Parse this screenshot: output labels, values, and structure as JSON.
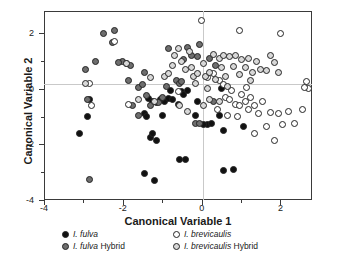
{
  "chart_data": {
    "type": "scatter",
    "title": "",
    "xlabel": "Canonical Variable 1",
    "ylabel": "Canonical Variable 2",
    "xlim": [
      -4,
      2.8
    ],
    "ylim": [
      -4,
      2.8
    ],
    "xticks": [
      -4,
      -2,
      0,
      2
    ],
    "yticks": [
      2,
      0,
      -2,
      -4
    ],
    "xtick_labels": [
      "-4",
      "-2",
      "0",
      "2"
    ],
    "ytick_labels": [
      "2",
      "0",
      "-2",
      "-4"
    ],
    "grid": "zero-lines-only",
    "legend_position": "below-axes",
    "series": [
      {
        "name": "I. fulva",
        "key": "f",
        "marker": "filled-circle",
        "color": "#111111",
        "edge_color": "#242424",
        "points": [
          [
            -1.35,
            -0.35
          ],
          [
            -1.25,
            -0.45
          ],
          [
            -1.15,
            -0.5
          ],
          [
            -1.45,
            -0.9
          ],
          [
            -1.4,
            -1.0
          ],
          [
            -1.3,
            -1.75
          ],
          [
            -1.25,
            -1.6
          ],
          [
            -1.15,
            -1.85
          ],
          [
            -1.0,
            -0.95
          ],
          [
            -0.95,
            -0.45
          ],
          [
            -0.85,
            -0.35
          ],
          [
            -0.8,
            -0.05
          ],
          [
            -0.75,
            -0.4
          ],
          [
            -0.6,
            -0.55
          ],
          [
            -0.5,
            -0.1
          ],
          [
            -0.45,
            -0.2
          ],
          [
            -0.35,
            -0.05
          ],
          [
            -0.55,
            -2.55
          ],
          [
            -0.4,
            -2.55
          ],
          [
            -1.2,
            -3.3
          ],
          [
            -1.45,
            -3.05
          ],
          [
            -2.9,
            -1.0
          ],
          [
            -3.1,
            -1.6
          ],
          [
            -2.85,
            -0.4
          ],
          [
            0.15,
            -1.3
          ],
          [
            0.25,
            -1.25
          ],
          [
            0.45,
            -0.95
          ],
          [
            0.5,
            0.0
          ],
          [
            0.55,
            -1.5
          ],
          [
            0.55,
            -2.95
          ],
          [
            0.8,
            -2.9
          ],
          [
            1.05,
            -1.35
          ],
          [
            -0.1,
            -0.45
          ],
          [
            -0.15,
            -0.95
          ],
          [
            0.05,
            -1.3
          ],
          [
            -1.05,
            -0.4
          ]
        ]
      },
      {
        "name": "I. fulva Hybrid",
        "key": "fh",
        "marker": "dark-gray-circle",
        "color": "#6e6e6e",
        "edge_color": "#242424",
        "points": [
          [
            -2.5,
            2.0
          ],
          [
            -2.2,
            2.1
          ],
          [
            -2.25,
            1.65
          ],
          [
            -2.7,
            1.0
          ],
          [
            -2.95,
            0.7
          ],
          [
            -2.9,
            -0.4
          ],
          [
            -2.85,
            -3.25
          ],
          [
            -2.0,
            1.0
          ],
          [
            -1.9,
            0.9
          ],
          [
            -1.8,
            0.85
          ],
          [
            -1.85,
            0.3
          ],
          [
            -1.75,
            -0.6
          ],
          [
            -1.6,
            0.05
          ],
          [
            -1.45,
            0.6
          ],
          [
            -1.5,
            0.15
          ],
          [
            -1.4,
            -0.25
          ],
          [
            -1.3,
            -0.6
          ],
          [
            -1.1,
            -0.5
          ],
          [
            -1.0,
            -0.3
          ],
          [
            -0.9,
            0.1
          ],
          [
            -0.65,
            0.3
          ],
          [
            -0.55,
            0.2
          ],
          [
            -0.45,
            1.05
          ],
          [
            -0.35,
            1.5
          ],
          [
            -0.25,
            1.2
          ],
          [
            -0.05,
            1.6
          ],
          [
            -0.1,
            1.15
          ],
          [
            0.2,
            1.1
          ],
          [
            0.35,
            0.85
          ],
          [
            -0.15,
            -1.25
          ],
          [
            -0.05,
            -1.25
          ],
          [
            0.3,
            -0.45
          ],
          [
            -0.5,
            0.25
          ],
          [
            -1.6,
            -0.95
          ],
          [
            -2.1,
            0.95
          ],
          [
            -0.85,
            1.45
          ]
        ]
      },
      {
        "name": "I. brevicaulis",
        "key": "b",
        "marker": "open-circle",
        "color": "#ffffff",
        "edge_color": "#242424",
        "points": [
          [
            -2.85,
            0.2
          ],
          [
            -2.8,
            -0.6
          ],
          [
            -2.2,
            1.7
          ],
          [
            -1.85,
            -0.55
          ],
          [
            -0.6,
            -0.1
          ],
          [
            0.0,
            2.45
          ],
          [
            0.95,
            2.1
          ],
          [
            2.0,
            2.0
          ],
          [
            0.45,
            0.3
          ],
          [
            0.55,
            0.15
          ],
          [
            0.6,
            -0.3
          ],
          [
            0.7,
            -0.4
          ],
          [
            0.75,
            -0.05
          ],
          [
            0.85,
            -0.55
          ],
          [
            0.95,
            -0.6
          ],
          [
            1.0,
            -0.2
          ],
          [
            1.1,
            -0.45
          ],
          [
            1.2,
            -0.75
          ],
          [
            1.25,
            -0.3
          ],
          [
            1.35,
            -0.6
          ],
          [
            1.45,
            -0.9
          ],
          [
            1.55,
            -0.45
          ],
          [
            1.65,
            -1.35
          ],
          [
            1.75,
            -0.85
          ],
          [
            1.85,
            -1.85
          ],
          [
            1.95,
            -0.9
          ],
          [
            2.05,
            -1.3
          ],
          [
            2.2,
            -0.8
          ],
          [
            2.35,
            -1.25
          ],
          [
            2.55,
            -0.75
          ],
          [
            2.65,
            0.25
          ],
          [
            2.7,
            0.0
          ],
          [
            2.6,
            0.05
          ],
          [
            1.35,
            -1.6
          ],
          [
            0.9,
            -1.0
          ],
          [
            0.65,
            -0.95
          ],
          [
            0.3,
            0.55
          ],
          [
            0.15,
            0.4
          ],
          [
            0.4,
            -0.75
          ],
          [
            1.15,
            0.05
          ]
        ]
      },
      {
        "name": "I. brevicaulis Hybrid",
        "key": "bh",
        "marker": "light-gray-circle",
        "color": "#d8d8d8",
        "edge_color": "#242424",
        "points": [
          [
            -2.95,
            0.2
          ],
          [
            -1.6,
            -0.4
          ],
          [
            -1.3,
            0.4
          ],
          [
            -1.2,
            -0.45
          ],
          [
            -0.95,
            0.45
          ],
          [
            -0.85,
            0.55
          ],
          [
            -0.75,
            0.85
          ],
          [
            -0.7,
            1.2
          ],
          [
            -0.6,
            1.45
          ],
          [
            -0.5,
            1.0
          ],
          [
            -0.4,
            0.7
          ],
          [
            -0.3,
            1.35
          ],
          [
            -0.25,
            0.75
          ],
          [
            -0.2,
            0.45
          ],
          [
            -0.15,
            0.2
          ],
          [
            -0.1,
            0.55
          ],
          [
            0.05,
            0.9
          ],
          [
            0.1,
            0.45
          ],
          [
            0.15,
            0.0
          ],
          [
            0.2,
            0.6
          ],
          [
            0.3,
            1.25
          ],
          [
            0.35,
            0.35
          ],
          [
            0.45,
            1.1
          ],
          [
            0.5,
            0.75
          ],
          [
            0.55,
            1.2
          ],
          [
            0.6,
            0.45
          ],
          [
            0.7,
            1.15
          ],
          [
            0.8,
            0.8
          ],
          [
            0.85,
            1.2
          ],
          [
            0.95,
            0.5
          ],
          [
            1.0,
            1.05
          ],
          [
            1.1,
            0.75
          ],
          [
            1.2,
            1.1
          ],
          [
            1.3,
            0.6
          ],
          [
            1.4,
            1.0
          ],
          [
            1.5,
            0.7
          ],
          [
            1.65,
            0.65
          ],
          [
            1.75,
            1.2
          ],
          [
            1.85,
            0.95
          ],
          [
            1.95,
            0.6
          ],
          [
            0.2,
            -0.4
          ],
          [
            0.45,
            -0.45
          ],
          [
            -0.35,
            -0.8
          ],
          [
            -0.55,
            -0.6
          ],
          [
            0.05,
            -0.6
          ],
          [
            0.65,
            0.1
          ],
          [
            1.25,
            0.3
          ],
          [
            -1.9,
            0.9
          ]
        ]
      }
    ]
  },
  "axes": {
    "x_title": "Canonical Variable 1",
    "y_title": "Canonical Variable 2"
  },
  "legend": {
    "items": [
      {
        "label_italic": "I. fulva",
        "label_plain": "",
        "key": "f"
      },
      {
        "label_italic": "I. brevicaulis",
        "label_plain": "",
        "key": "b"
      },
      {
        "label_italic": "I. fulva",
        "label_plain": " Hybrid",
        "key": "fh"
      },
      {
        "label_italic": "I. brevicaulis",
        "label_plain": "  Hybrid",
        "key": "bh"
      }
    ]
  },
  "caption": ""
}
